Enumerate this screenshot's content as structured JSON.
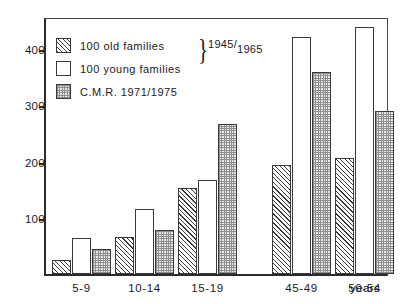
{
  "chart_data": {
    "type": "bar",
    "title": "",
    "xlabel": "years",
    "ylabel": "",
    "ylim": [
      0,
      460
    ],
    "yticks": [
      100,
      200,
      300,
      400
    ],
    "grid": false,
    "legend_position": "top-left",
    "categories": [
      "5-9",
      "10-14",
      "15-19",
      "45-49",
      "50-54"
    ],
    "series": [
      {
        "name": "100 old families",
        "pattern": "diagonal-hatch",
        "values": [
          25,
          65,
          152,
          193,
          205
        ]
      },
      {
        "name": "100 young families",
        "pattern": "empty",
        "values": [
          63,
          115,
          167,
          420,
          437
        ]
      },
      {
        "name": "C.M.R. 1971/1975",
        "pattern": "dotted",
        "values": [
          45,
          77,
          265,
          358,
          288
        ]
      }
    ],
    "annotations": [
      {
        "text": "1945/1965",
        "note": "brace spanning the first two legend entries"
      }
    ]
  },
  "legend": {
    "items": [
      {
        "label": "100 old families",
        "swatch": "hatch"
      },
      {
        "label": "100 young families",
        "swatch": "plain"
      },
      {
        "label": "C.M.R. 1971/1975",
        "swatch": "dotted"
      }
    ],
    "brace_glyph": "}",
    "brace_label_main": "1945/",
    "brace_label_sub": "1965"
  },
  "axes": {
    "y_tick_labels": [
      "400",
      "300",
      "200",
      "100"
    ],
    "x_tick_labels": [
      "5-9",
      "10-14",
      "15-19",
      "45-49",
      "50-54"
    ],
    "x_unit_label": "years"
  }
}
